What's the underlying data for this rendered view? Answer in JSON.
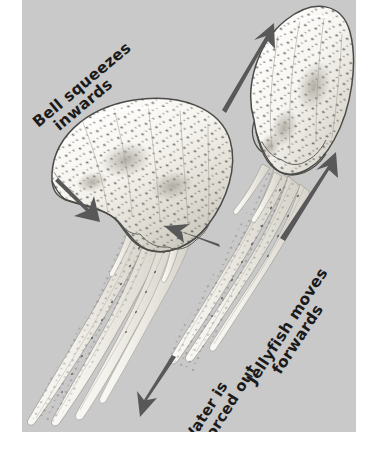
{
  "figure": {
    "kind": "scientific-illustration",
    "background_color": "#ffffff",
    "panel_color": "#c9c9c9",
    "ink_color": "#1a1a1a",
    "arrow_color": "#585858",
    "body_color": "#fbfaf6"
  },
  "labels": {
    "bell": {
      "line1": "Bell squeezes",
      "line2": "inwards"
    },
    "water": {
      "line1": "Water is",
      "line2": "forced out"
    },
    "jellyfish": {
      "line1": "Jellyfish  moves",
      "line2": "forwards"
    }
  },
  "arrows": [
    {
      "name": "bell-squeeze-left-arrow",
      "direction": "down-right",
      "points_to": "left-jellyfish-bell-left-margin"
    },
    {
      "name": "bell-squeeze-right-arrow",
      "direction": "left",
      "points_to": "left-jellyfish-bell-right-margin"
    },
    {
      "name": "water-forced-out-arrow",
      "direction": "down-left",
      "points_to": "below-left-jellyfish-tentacles"
    },
    {
      "name": "jellyfish-forwards-upper-arrow",
      "direction": "up-right",
      "points_to": "above-right-jellyfish-bell"
    },
    {
      "name": "jellyfish-forwards-lower-arrow",
      "direction": "up-right",
      "points_to": "right-of-right-jellyfish-bell"
    }
  ],
  "organisms": [
    {
      "name": "left-jellyfish",
      "state": "bell-relaxed-expanded",
      "bell_shape": "wide-dome-scalloped-margin",
      "tentacles": "long-trailing-down-left"
    },
    {
      "name": "right-jellyfish",
      "state": "bell-contracted-elongated",
      "bell_shape": "narrow-elongated-bullet",
      "tentacles": "trailing-down-left"
    }
  ]
}
